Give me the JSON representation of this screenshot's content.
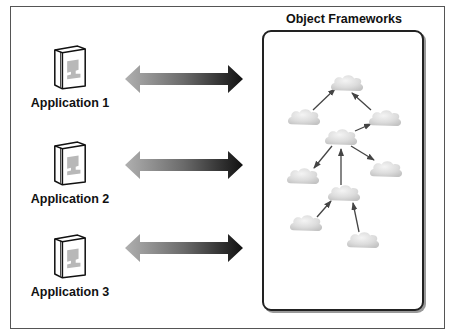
{
  "diagram": {
    "applications": [
      {
        "label": "Application 1",
        "icon": "application-book-icon"
      },
      {
        "label": "Application 2",
        "icon": "application-book-icon"
      },
      {
        "label": "Application 3",
        "icon": "application-book-icon"
      }
    ],
    "connector": {
      "type": "bidirectional-arrow",
      "gradient_from": "#b0b0b0",
      "gradient_to": "#111111"
    },
    "panel": {
      "title": "Object Frameworks",
      "nodes": [
        {
          "id": "top",
          "shape": "cloud"
        },
        {
          "id": "left",
          "shape": "cloud"
        },
        {
          "id": "right",
          "shape": "cloud"
        },
        {
          "id": "center",
          "shape": "cloud"
        },
        {
          "id": "mid-left",
          "shape": "cloud"
        },
        {
          "id": "mid-right",
          "shape": "cloud"
        },
        {
          "id": "lower-center",
          "shape": "cloud"
        },
        {
          "id": "bottom-left",
          "shape": "cloud"
        },
        {
          "id": "bottom-right",
          "shape": "cloud"
        }
      ],
      "edges": [
        {
          "from": "left",
          "to": "top"
        },
        {
          "from": "right",
          "to": "top"
        },
        {
          "from": "center",
          "to": "right"
        },
        {
          "from": "center",
          "to": "mid-left"
        },
        {
          "from": "center",
          "to": "mid-right"
        },
        {
          "from": "lower-center",
          "to": "center"
        },
        {
          "from": "bottom-left",
          "to": "lower-center"
        },
        {
          "from": "bottom-right",
          "to": "lower-center"
        }
      ]
    }
  }
}
